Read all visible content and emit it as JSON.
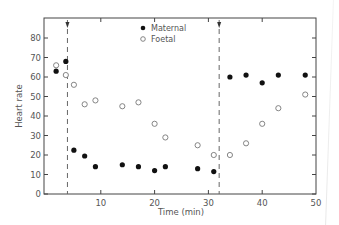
{
  "chart_data": {
    "type": "scatter",
    "title": "",
    "xlabel": "Time (min)",
    "ylabel": "Heart rate",
    "xlim": [
      0,
      50
    ],
    "ylim": [
      0,
      85
    ],
    "xticks": [
      10,
      20,
      30,
      40,
      50
    ],
    "yticks": [
      0,
      10,
      20,
      30,
      40,
      50,
      60,
      70,
      80
    ],
    "grid": false,
    "legend_position": "top-center",
    "series": [
      {
        "name": "Maternal",
        "marker": "filled-circle",
        "color": "#111111",
        "x": [
          1.7,
          3.5,
          5,
          7,
          9,
          14,
          17,
          20,
          22,
          28,
          31,
          34,
          37,
          40,
          43,
          48
        ],
        "y": [
          63,
          68,
          22.5,
          19.5,
          14,
          15,
          14,
          12,
          14,
          13,
          11.5,
          60,
          61,
          57,
          61,
          61
        ]
      },
      {
        "name": "Foetal",
        "marker": "open-circle",
        "color": "#777777",
        "x": [
          1.7,
          3.5,
          5,
          7,
          9,
          14,
          17,
          20,
          22,
          28,
          31,
          34,
          37,
          40,
          43,
          48
        ],
        "y": [
          66,
          61,
          56,
          46,
          48,
          45,
          47,
          36,
          29,
          25,
          20,
          20,
          26,
          36,
          44,
          51
        ]
      }
    ],
    "annotations": [
      {
        "type": "dashed-vertical-arrow",
        "x": 3.8,
        "direction": "down"
      },
      {
        "type": "dashed-vertical-arrow",
        "x": 32,
        "direction": "up"
      }
    ]
  }
}
